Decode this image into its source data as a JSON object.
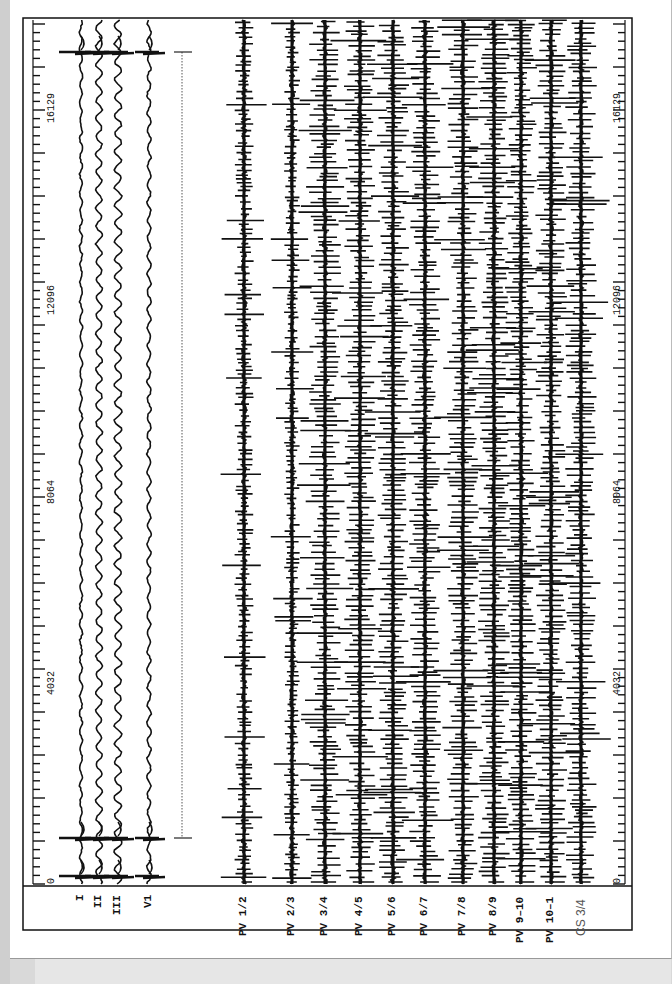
{
  "chart_data": {
    "type": "line",
    "title": "",
    "orientation": "rotated-90-ccw (time runs bottom to top)",
    "xlabel": "",
    "ylabel": "",
    "time_axis": {
      "ticks": [
        0,
        4032,
        8064,
        12096,
        16129
      ],
      "range": [
        0,
        18300
      ]
    },
    "surface_leads": [
      "I",
      "II",
      "III",
      "V1"
    ],
    "intracardiac_leads": [
      "PV 1/2",
      "PV 2/3",
      "PV 3/4",
      "PV 4/5",
      "PV 5/6",
      "PV 6/7",
      "PV 7/8",
      "PV 8/9",
      "PV 9–10",
      "PV 10–1",
      "CS 3/4"
    ],
    "series": [
      {
        "name": "I",
        "type": "surface",
        "baseline_px": 81,
        "qrs_times": [
          320,
          17580
        ]
      },
      {
        "name": "II",
        "type": "surface",
        "baseline_px": 99,
        "qrs_times": [
          320,
          17580
        ]
      },
      {
        "name": "III",
        "type": "surface",
        "baseline_px": 118,
        "qrs_times": [
          320,
          17580
        ]
      },
      {
        "name": "V1",
        "type": "surface",
        "baseline_px": 149,
        "qrs_times": [
          320,
          17580
        ]
      },
      {
        "name": "PV 1/2",
        "type": "fibrillatory",
        "baseline_px": 244
      },
      {
        "name": "PV 2/3",
        "type": "fibrillatory",
        "baseline_px": 292
      },
      {
        "name": "PV 3/4",
        "type": "fibrillatory",
        "baseline_px": 325
      },
      {
        "name": "PV 4/5",
        "type": "fibrillatory",
        "baseline_px": 360
      },
      {
        "name": "PV 5/6",
        "type": "fibrillatory",
        "baseline_px": 393
      },
      {
        "name": "PV 6/7",
        "type": "fibrillatory",
        "baseline_px": 425
      },
      {
        "name": "PV 7/8",
        "type": "fibrillatory",
        "baseline_px": 463
      },
      {
        "name": "PV 8/9",
        "type": "fibrillatory",
        "baseline_px": 494
      },
      {
        "name": "PV 9–10",
        "type": "fibrillatory",
        "baseline_px": 521
      },
      {
        "name": "PV 10–1",
        "type": "fibrillatory",
        "baseline_px": 551
      },
      {
        "name": "CS 3/4",
        "type": "fibrillatory",
        "baseline_px": 581
      }
    ],
    "annotations": [
      {
        "type": "interval-bracket",
        "from_y_px": 52,
        "to_y_px": 838,
        "x_px": 182,
        "style": "dotted"
      }
    ],
    "grid": false,
    "legend": "lead labels below plot area, rotated"
  },
  "labels": {
    "leads": [
      "I",
      "II",
      "III",
      "V1",
      "PV 1/2",
      "PV 2/3",
      "PV 3/4",
      "PV 4/5",
      "PV 5/6",
      "PV 6/7",
      "PV 7/8",
      "PV 8/9",
      "PV 9–10",
      "PV 10–1",
      "CS 3/4"
    ],
    "ticks_left": [
      "0",
      "4032",
      "8064",
      "12096",
      "16129"
    ],
    "ticks_right": [
      "0",
      "4032",
      "8064",
      "12096",
      "16129"
    ]
  }
}
